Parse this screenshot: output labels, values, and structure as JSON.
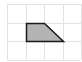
{
  "diagram": {
    "type": "grid-shape",
    "grid": {
      "columns": 4,
      "rows": 3,
      "origin_x": 7,
      "origin_y": 4,
      "cell_size": 18.5,
      "line_color": "#e2e2e2"
    },
    "shape": {
      "name": "trapezoid",
      "vertices_grid": [
        [
          1,
          1
        ],
        [
          2,
          1
        ],
        [
          3,
          2
        ],
        [
          1,
          2
        ]
      ],
      "fill_color": "#b3b3b3",
      "stroke_color": "#1a1a1a"
    }
  }
}
